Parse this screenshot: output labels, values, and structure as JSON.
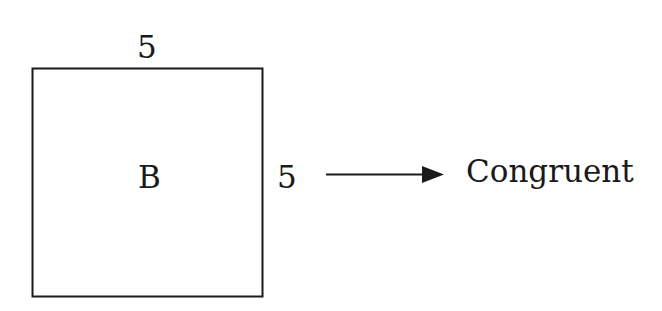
{
  "diagram": {
    "shape": {
      "type": "square",
      "label": "B",
      "top_side_length": "5",
      "right_side_length": "5"
    },
    "arrow": {
      "direction": "right"
    },
    "conclusion": "Congruent"
  },
  "colors": {
    "stroke": "#1a1a1a",
    "background": "#ffffff"
  }
}
